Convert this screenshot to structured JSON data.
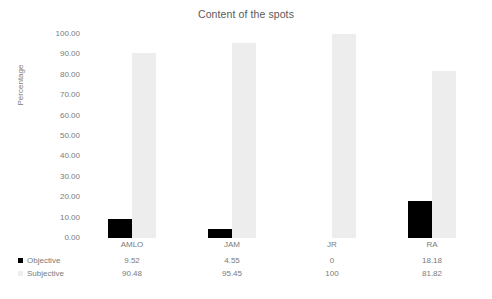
{
  "chart_data": {
    "type": "bar",
    "title": "Content of the spots",
    "xlabel": "",
    "ylabel": "Percentage",
    "ylim": [
      0,
      100
    ],
    "grid": true,
    "legend_position": "bottom-table",
    "categories": [
      "AMLO",
      "JAM",
      "JR",
      "RA"
    ],
    "ytick_labels": [
      "100.00",
      "90.00",
      "80.00",
      "70.00",
      "60.00",
      "50.00",
      "40.00",
      "30.00",
      "20.00",
      "10.00",
      "0.00"
    ],
    "ytick_values": [
      100,
      90,
      80,
      70,
      60,
      50,
      40,
      30,
      20,
      10,
      0
    ],
    "series": [
      {
        "name": "Objective",
        "color": "#000000",
        "values": [
          9.52,
          4.55,
          0,
          18.18
        ],
        "labels": [
          "9.52",
          "4.55",
          "0",
          "18.18"
        ]
      },
      {
        "name": "Subjective",
        "color": "#ededed",
        "values": [
          90.48,
          95.45,
          100,
          81.82
        ],
        "labels": [
          "90.48",
          "95.45",
          "100",
          "81.82"
        ]
      }
    ]
  }
}
